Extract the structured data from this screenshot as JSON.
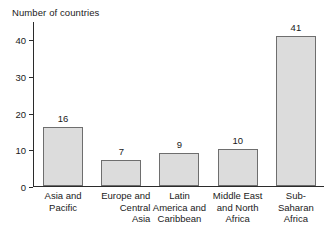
{
  "chart_data": {
    "type": "bar",
    "title": "",
    "xlabel": "",
    "ylabel": "Number of countries",
    "ylim": [
      0,
      45
    ],
    "yticks": [
      0,
      10,
      20,
      30,
      40
    ],
    "grid": false,
    "legend": null,
    "categories": [
      "Asia and Pacific",
      "Europe and Central Asia",
      "Latin America and Caribbean",
      "Middle East and North Africa",
      "Sub-Saharan Africa"
    ],
    "category_lines": [
      [
        "Asia and",
        "Pacific"
      ],
      [
        "Europe and",
        "Central",
        "Asia"
      ],
      [
        "Latin",
        "America and",
        "Caribbean"
      ],
      [
        "Middle East",
        "and North",
        "Africa"
      ],
      [
        "Sub-",
        "Saharan",
        "Africa"
      ]
    ],
    "category_align": [
      "center",
      "right",
      "center",
      "center",
      "center"
    ],
    "values": [
      16,
      7,
      9,
      10,
      41
    ],
    "value_labels": [
      "16",
      "7",
      "9",
      "10",
      "41"
    ],
    "bar_fill": "#dcdcdc",
    "bar_stroke": "#6e6e6e",
    "axis_color": "#2b2b2b",
    "text_color": "#1a1a1a"
  },
  "axis": {
    "y_title": "Number of countries",
    "y_tick_labels": [
      "0",
      "10",
      "20",
      "30",
      "40"
    ]
  }
}
